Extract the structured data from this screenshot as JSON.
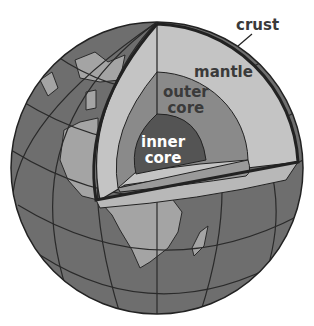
{
  "figure": {
    "labels": {
      "crust": "crust",
      "mantle": "mantle",
      "outer_core_line1": "outer",
      "outer_core_line2": "core",
      "inner_core_line1": "inner",
      "inner_core_line2": "core"
    },
    "colors": {
      "ocean": "#6e6e6e",
      "land": "#a4a4a4",
      "crust_line": "#2a2a2a",
      "mantle": "#c4c4c4",
      "outer_core": "#8a8a8a",
      "inner_core": "#545454",
      "outline": "#222222"
    }
  }
}
